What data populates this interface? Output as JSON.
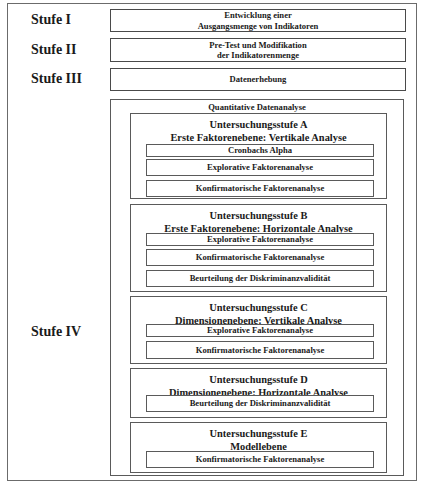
{
  "stages": [
    {
      "label": "Stufe I",
      "lines": [
        "Entwicklung einer",
        "Ausgangsmenge von Indikatoren"
      ]
    },
    {
      "label": "Stufe II",
      "lines": [
        "Pre-Test und Modifikation",
        "der Indikatorenmenge"
      ]
    },
    {
      "label": "Stufe III",
      "lines": [
        "Datenerhebung"
      ]
    },
    {
      "label": "Stufe IV",
      "title": "Quantitative Datenanalyse"
    }
  ],
  "substages": [
    {
      "title": "Untersuchungsstufe A",
      "subtitle": "Erste Faktorenebene: Vertikale Analyse",
      "items": [
        "Cronbachs Alpha",
        "Explorative Faktorenanalyse",
        "Konfirmatorische Faktorenanalyse"
      ]
    },
    {
      "title": "Untersuchungsstufe B",
      "subtitle": "Erste Faktorenebene: Horizontale Analyse",
      "items": [
        "Explorative Faktorenanalyse",
        "Konfirmatorische Faktorenanalyse",
        "Beurteilung der Diskriminanzvalidität"
      ]
    },
    {
      "title": "Untersuchungsstufe C",
      "subtitle": "Dimensionenebene: Vertikale Analyse",
      "items": [
        "Explorative Faktorenanalyse",
        "Konfirmatorische Faktorenanalyse"
      ]
    },
    {
      "title": "Untersuchungsstufe D",
      "subtitle": "Dimensionenebene: Horizontale Analyse",
      "items": [
        "Beurteilung der Diskriminanzvalidität"
      ]
    },
    {
      "title": "Untersuchungsstufe E",
      "subtitle": "Modellebene",
      "items": [
        "Konfirmatorische Faktorenanalyse"
      ]
    }
  ]
}
